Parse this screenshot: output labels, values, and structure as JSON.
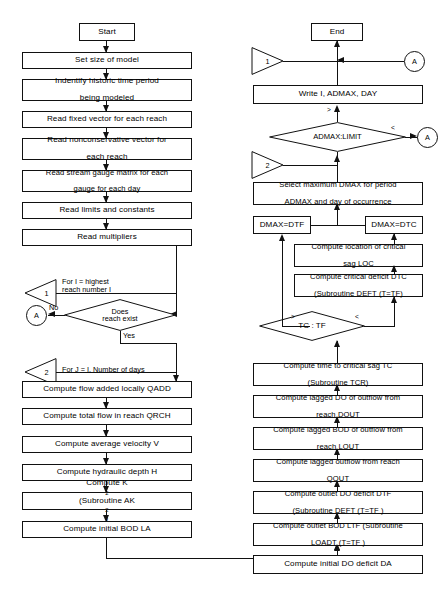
{
  "colors": {
    "line": "#111111",
    "fill": "#ffffff",
    "text": "#000000"
  },
  "left_column": {
    "terminal_start": "Start",
    "boxes": [
      {
        "id": "set-size",
        "text": "Set size of model"
      },
      {
        "id": "identify-period",
        "line1": "Indentify historic time period",
        "line2": "being modeled"
      },
      {
        "id": "read-fixed-vector",
        "text": "Read fixed vector for each reach"
      },
      {
        "id": "read-nonconservative",
        "line1": "Read nonconservative vector for",
        "line2": "each reach"
      },
      {
        "id": "read-stream-gauge",
        "line1": "Read stream gauge matrix for each",
        "line2": "gauge for each day"
      },
      {
        "id": "read-limits",
        "text": "Read limits and constants"
      },
      {
        "id": "read-multipliers",
        "text": "Read multipliers"
      },
      {
        "id": "compute-qadd",
        "text": "Compute flow added locally QADD"
      },
      {
        "id": "compute-qrch",
        "text": "Compute total flow in reach QRCH"
      },
      {
        "id": "compute-velocity",
        "text": "Compute average velocity  V"
      },
      {
        "id": "compute-depth",
        "text": "Compute hydraulic depth  H"
      },
      {
        "id": "compute-k2",
        "pre": "Compute K",
        "sub": "2",
        "post": " (Subroutine AK",
        "sub2": "2",
        "post2": ")"
      },
      {
        "id": "compute-bod-la",
        "text": "Compute initial BOD LA"
      }
    ],
    "loop_markers": [
      {
        "id": "loop-1",
        "label": "1",
        "text_line1": "For I = highest",
        "text_line2": "reach number I"
      },
      {
        "id": "loop-2",
        "label": "2",
        "text_line1": "For J = I, Number of days"
      }
    ],
    "decision": {
      "id": "does-reach-exist",
      "line1": "Does",
      "line2": "reach exist",
      "branch_no": "No",
      "branch_yes": "Yes"
    },
    "connector_a": "A"
  },
  "right_column": {
    "terminal_end": "End",
    "boxes": [
      {
        "id": "write-results",
        "text": "Write I, ADMAX, DAY"
      },
      {
        "id": "select-dmax",
        "line1": "Select maximum DMAX for period",
        "line2": "ADMAX and day of occurrence"
      },
      {
        "id": "dmax-dtf",
        "text": "DMAX=DTF"
      },
      {
        "id": "dmax-dtc",
        "text": "DMAX=DTC"
      },
      {
        "id": "compute-loc",
        "line1": "Compute location of critical",
        "line2": "sag LOC"
      },
      {
        "id": "compute-dtc",
        "line1": "Compute critical deficit  DTC",
        "line2": "(Subroutine DEFT (T=TF)"
      },
      {
        "id": "compute-tc",
        "line1": "Compute time to critical sag  TC",
        "line2": "(Subroutine  TCR)"
      },
      {
        "id": "compute-dout",
        "line1": "Compute lagged DO of outflow from",
        "line2": "reach  DOUT"
      },
      {
        "id": "compute-lout",
        "line1": "Compute lagged BOD of outflow from",
        "line2": "reach  LOUT"
      },
      {
        "id": "compute-qout",
        "line1": "Compute lagged outflow from reach",
        "line2": "QOUT"
      },
      {
        "id": "compute-dtf",
        "line1": "Compute outlet DO deficit DTF",
        "line2": "(Subroutine DEFT (T=TF )"
      },
      {
        "id": "compute-ltf",
        "line1": "Compute outlet BOD LTF (Subroutine",
        "line2": "LOADT (T=TF )"
      },
      {
        "id": "compute-da",
        "text": "Compute initial DO deficit DA"
      }
    ],
    "decisions": [
      {
        "id": "admax-limit",
        "text": "ADMAX:LIMIT",
        "branch_top": ">",
        "branch_right": "<"
      },
      {
        "id": "tc-tf",
        "text": "TC : TF",
        "branch_left": ">",
        "branch_right": "<"
      }
    ],
    "loop_markers": [
      {
        "id": "loop-1-right",
        "label": "1"
      },
      {
        "id": "loop-2-right",
        "label": "2"
      }
    ],
    "connectors": [
      {
        "id": "connector-a-top",
        "label": "A"
      },
      {
        "id": "connector-a-mid",
        "label": "A"
      }
    ]
  }
}
